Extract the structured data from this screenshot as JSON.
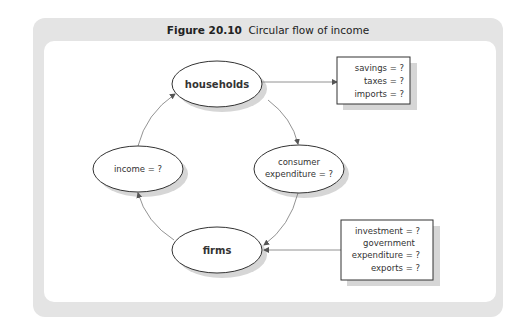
{
  "figure": {
    "number": "Figure 20.10",
    "caption": "Circular flow of income"
  },
  "nodes": {
    "households": "households",
    "firms": "firms",
    "income": "income = ?",
    "consumer_line1": "consumer",
    "consumer_line2": "expenditure = ?"
  },
  "withdrawals": [
    "savings = ?",
    "taxes = ?",
    "imports = ?"
  ],
  "injections": [
    "investment = ?",
    "government",
    "expenditure = ?",
    "exports = ?"
  ],
  "colors": {
    "frame": "#e4e4e4",
    "panel": "#ffffff",
    "stroke": "#333333",
    "arrow": "#777777",
    "shadow": "#d6d6d6"
  }
}
